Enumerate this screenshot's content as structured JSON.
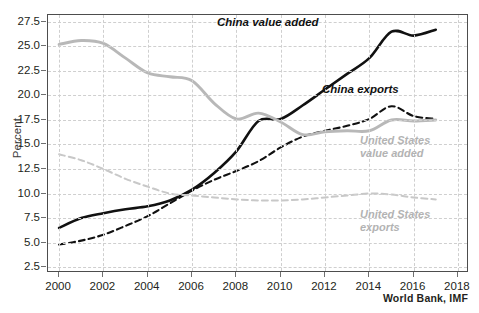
{
  "chart_data": {
    "type": "line",
    "title": "",
    "xlabel": "",
    "ylabel": "Percent",
    "xlim": [
      1999.5,
      2018.5
    ],
    "ylim": [
      1.9,
      28.2
    ],
    "grid": true,
    "legend_position": "inline-annotations",
    "source": "World Bank, IMF",
    "x_ticks": [
      "2000",
      "2002",
      "2004",
      "2006",
      "2008",
      "2010",
      "2012",
      "2014",
      "2016",
      "2018"
    ],
    "x_tick_values": [
      2000,
      2002,
      2004,
      2006,
      2008,
      2010,
      2012,
      2014,
      2016,
      2018
    ],
    "y_ticks": [
      "2.5",
      "5.0",
      "7.5",
      "10.0",
      "12.5",
      "15.0",
      "17.5",
      "20.0",
      "22.5",
      "25.0",
      "27.5"
    ],
    "y_tick_values": [
      2.5,
      5.0,
      7.5,
      10.0,
      12.5,
      15.0,
      17.5,
      20.0,
      22.5,
      25.0,
      27.5
    ],
    "x": [
      2000,
      2001,
      2002,
      2003,
      2004,
      2005,
      2006,
      2007,
      2008,
      2009,
      2010,
      2011,
      2012,
      2013,
      2014,
      2015,
      2016,
      2017
    ],
    "series": [
      {
        "name": "China value added",
        "color": "#111111",
        "style": "solid",
        "label_lines": [
          "China value added"
        ],
        "values": [
          6.5,
          7.5,
          8.0,
          8.4,
          8.7,
          9.3,
          10.4,
          12.1,
          14.3,
          17.4,
          17.6,
          19.0,
          20.6,
          22.2,
          23.8,
          26.5,
          26.1,
          26.7
        ]
      },
      {
        "name": "China exports",
        "color": "#111111",
        "style": "dashed",
        "label_lines": [
          "China exports"
        ],
        "values": [
          4.8,
          5.2,
          5.8,
          6.7,
          7.7,
          9.0,
          10.3,
          11.4,
          12.3,
          13.3,
          14.7,
          15.8,
          16.4,
          16.9,
          17.6,
          18.9,
          17.9,
          17.6
        ]
      },
      {
        "name": "United States value added",
        "color": "#b8b8b8",
        "style": "solid",
        "label_lines": [
          "United States",
          "value added"
        ],
        "values": [
          25.2,
          25.6,
          25.3,
          23.8,
          22.3,
          21.9,
          21.5,
          19.2,
          17.6,
          18.2,
          17.3,
          16.0,
          16.3,
          16.4,
          16.4,
          17.5,
          17.4,
          17.5
        ]
      },
      {
        "name": "United States exports",
        "color": "#c8c8c8",
        "style": "dashed",
        "label_lines": [
          "United States",
          "exports"
        ],
        "values": [
          14.0,
          13.4,
          12.5,
          11.5,
          10.7,
          10.0,
          9.8,
          9.6,
          9.4,
          9.3,
          9.3,
          9.4,
          9.6,
          9.8,
          10.0,
          9.9,
          9.6,
          9.4
        ]
      }
    ]
  }
}
